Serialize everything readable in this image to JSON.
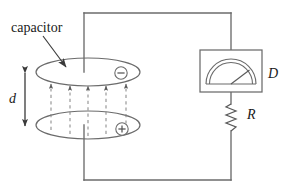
{
  "figure": {
    "type": "circuit-diagram",
    "background_color": "#ffffff",
    "line_color": "#4d4d4d",
    "text_color": "#1a1a1a",
    "width": 297,
    "height": 194
  },
  "labels": {
    "capacitor": "capacitor",
    "plate_separation": "d",
    "meter": "D",
    "resistor": "R"
  },
  "charges": {
    "top_plate": "−",
    "bottom_plate": "+"
  },
  "components": {
    "capacitor": {
      "name": "capacitor",
      "top_plate": {
        "cx": 88,
        "cy": 72,
        "rx": 52,
        "ry": 14
      },
      "bottom_plate": {
        "cx": 88,
        "cy": 125,
        "rx": 52,
        "ry": 14
      },
      "field_line_count": 5,
      "field_line_style": "dashed"
    },
    "meter": {
      "name": "galvanometer",
      "box": {
        "x": 200,
        "y": 50,
        "w": 62,
        "h": 42
      },
      "needle_angle_deg": 35
    },
    "resistor": {
      "name": "resistor",
      "x": 231,
      "y_top": 103,
      "y_bottom": 132,
      "zigzag_peaks": 6
    },
    "wires": {
      "top_y": 13,
      "bottom_y": 180,
      "left_x": 84,
      "right_x": 231
    },
    "dimension_arrow": {
      "x": 25,
      "y_top": 72,
      "y_bottom": 126
    },
    "pointer_arrow": {
      "from": [
        43,
        36
      ],
      "to": [
        66,
        67
      ]
    }
  }
}
